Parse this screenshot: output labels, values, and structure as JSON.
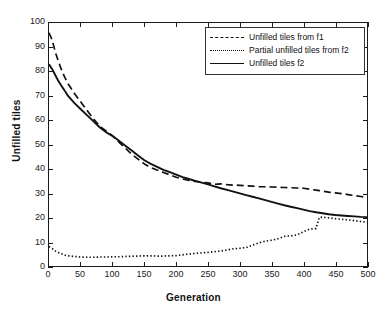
{
  "chart_data": {
    "type": "line",
    "title": "",
    "xlabel": "Generation",
    "ylabel": "Unfilled tiles",
    "xlim": [
      0,
      500
    ],
    "ylim": [
      0,
      100
    ],
    "xticks": [
      0,
      50,
      100,
      150,
      200,
      250,
      300,
      350,
      400,
      450,
      500
    ],
    "yticks": [
      0,
      10,
      20,
      30,
      40,
      50,
      60,
      70,
      80,
      90,
      100
    ],
    "grid": false,
    "legend_position": "top-right",
    "x": [
      0,
      5,
      10,
      15,
      20,
      25,
      30,
      40,
      50,
      60,
      70,
      80,
      90,
      100,
      110,
      120,
      130,
      140,
      150,
      160,
      170,
      180,
      190,
      200,
      210,
      220,
      230,
      240,
      250,
      260,
      270,
      280,
      290,
      300,
      310,
      320,
      330,
      340,
      350,
      360,
      370,
      380,
      390,
      400,
      410,
      420,
      425,
      430,
      440,
      450,
      460,
      470,
      480,
      490,
      500
    ],
    "series": [
      {
        "name": "Unfilled tiles from f1",
        "style": "dashed",
        "color": "#111111",
        "values": [
          96,
          93,
          88,
          84,
          80.5,
          77.5,
          75,
          71,
          67.5,
          64,
          60.5,
          57.5,
          55.5,
          53.5,
          51,
          48.5,
          46,
          44,
          42,
          40.5,
          39.5,
          38.5,
          37.5,
          36.5,
          35.8,
          35.2,
          34.8,
          34.5,
          34.2,
          33.6,
          33.8,
          33.5,
          33.3,
          33.2,
          33,
          32.9,
          32.7,
          32.6,
          32.5,
          32.4,
          32.3,
          32.2,
          32.1,
          32,
          31.6,
          31.2,
          31,
          30.8,
          30.4,
          30.1,
          29.8,
          29.4,
          29,
          28.6,
          28.2
        ]
      },
      {
        "name": "Partial unfilled tiles from f2",
        "style": "dotted",
        "color": "#111111",
        "values": [
          8,
          7.2,
          6.2,
          5.5,
          5,
          4.5,
          4.2,
          3.9,
          3.7,
          3.6,
          3.6,
          3.7,
          3.7,
          3.8,
          3.8,
          3.9,
          4,
          4.1,
          4.2,
          4.2,
          4.1,
          4.1,
          4.2,
          4.3,
          4.6,
          4.9,
          5.2,
          5.4,
          5.6,
          5.9,
          6.2,
          6.6,
          7.1,
          7.3,
          7.6,
          8.6,
          9.5,
          10.2,
          10.6,
          11.2,
          12.2,
          12.4,
          12.8,
          14.1,
          15.2,
          15.4,
          20,
          20.1,
          19.8,
          19.5,
          19.2,
          19,
          18.7,
          18.3,
          18
        ]
      },
      {
        "name": "Unfilled tiles f2",
        "style": "solid",
        "color": "#111111",
        "values": [
          83,
          81,
          78.5,
          76,
          74,
          72,
          70,
          67,
          64.5,
          62,
          59.5,
          57,
          55,
          53.5,
          51.5,
          49.5,
          47.5,
          45.5,
          43.5,
          42,
          40.8,
          39.6,
          38.6,
          37.6,
          36.6,
          35.8,
          35,
          34.3,
          33.6,
          32.8,
          32,
          31.3,
          30.6,
          29.9,
          29.2,
          28.5,
          27.8,
          27.1,
          26.4,
          25.7,
          25,
          24.4,
          23.8,
          23.2,
          22.6,
          22.1,
          21.9,
          21.7,
          21.3,
          21,
          20.8,
          20.6,
          20.4,
          20.2,
          20.1
        ]
      }
    ]
  },
  "legend": {
    "items": [
      {
        "label": "Unfilled tiles from f1"
      },
      {
        "label": "Partial unfilled tiles from f2"
      },
      {
        "label": "Unfilled tiles f2"
      }
    ]
  }
}
